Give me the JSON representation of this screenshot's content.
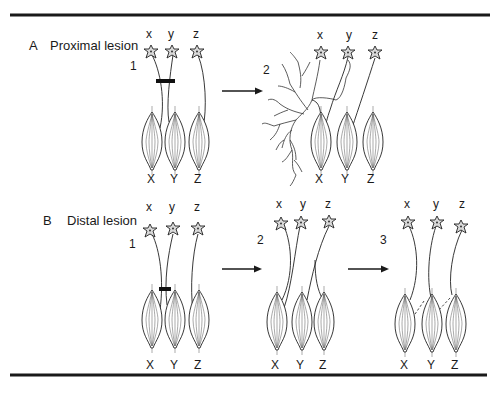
{
  "figure": {
    "colors": {
      "ink": "#1a1a1a",
      "soma_fill": "#d9d9d9",
      "background": "#ffffff"
    },
    "panels": [
      {
        "id": "A",
        "letter": "A",
        "title": "Proximal lesion",
        "stages": [
          {
            "number": "1",
            "neuron_labels": [
              "x",
              "y",
              "z"
            ],
            "muscle_labels": [
              "X",
              "Y",
              "Z"
            ],
            "description": "lesion bar across axons x and y near cell bodies"
          },
          {
            "number": "2",
            "neuron_labels": [
              "x",
              "y",
              "z"
            ],
            "muscle_labels": [
              "X",
              "Y",
              "Z"
            ],
            "description": "regenerating axons sprout and branch"
          }
        ]
      },
      {
        "id": "B",
        "letter": "B",
        "title": "Distal lesion",
        "stages": [
          {
            "number": "1",
            "neuron_labels": [
              "x",
              "y",
              "z"
            ],
            "muscle_labels": [
              "X",
              "Y",
              "Z"
            ],
            "description": "lesion bar across axons x and y near muscles"
          },
          {
            "number": "2",
            "neuron_labels": [
              "x",
              "y",
              "z"
            ],
            "muscle_labels": [
              "X",
              "Y",
              "Z"
            ],
            "description": "axons regrow along crossed paths"
          },
          {
            "number": "3",
            "neuron_labels": [
              "x",
              "y",
              "z"
            ],
            "muscle_labels": [
              "X",
              "Y",
              "Z"
            ],
            "description": "dashed lines show original innervation paths"
          }
        ]
      }
    ]
  }
}
